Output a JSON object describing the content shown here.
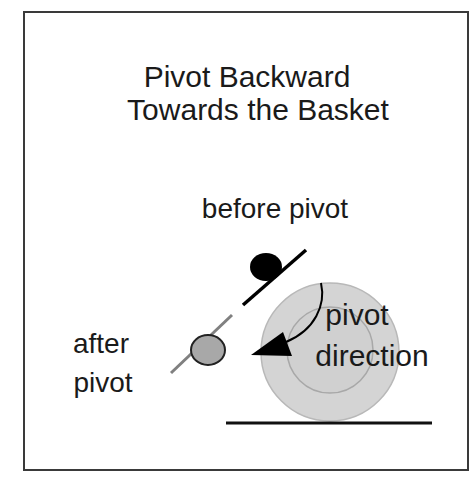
{
  "title": {
    "line1": "Pivot Backward",
    "line2": "Towards the Basket"
  },
  "labels": {
    "before": "before pivot",
    "after_line1": "after",
    "after_line2": "pivot",
    "direction_line1": "pivot",
    "direction_line2": "direction"
  },
  "icons": {
    "player_before": "black-circle",
    "player_after": "gray-circle",
    "pivot_arrow": "curved-arrow-left",
    "basket": "concentric-circles",
    "baseline": "horizontal-line"
  },
  "colors": {
    "border": "#3a3a3a",
    "text": "#1a1a1a",
    "player_before_fill": "#000000",
    "player_after_fill": "#a8a8a8",
    "player_after_stroke": "#222222",
    "after_line": "#808080",
    "basket_fill": "#d4d4d4",
    "basket_stroke": "#b4b4b4",
    "baseline": "#111111"
  }
}
